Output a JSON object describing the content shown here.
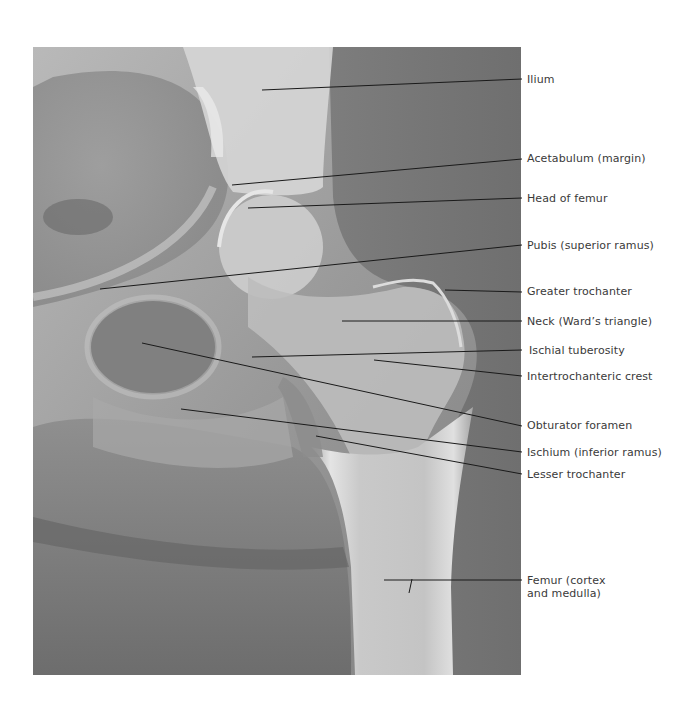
{
  "figure": {
    "image_description": "Anteroposterior radiograph of the right hip and proximal femur",
    "colors": {
      "background": "#ffffff",
      "leader_line": "#1a1a1a",
      "label_text": "#3a3a3a",
      "bone_light": "#d8d8d8",
      "soft_tissue": "#8a8a8a",
      "dark_region": "#5e5e5e"
    },
    "labels": [
      {
        "id": "ilium",
        "text": "Ilium",
        "top": 73,
        "line": [
          262,
          90,
          522,
          79
        ]
      },
      {
        "id": "acetabulum",
        "text": "Acetabulum (margin)",
        "top": 152,
        "line": [
          232,
          185,
          522,
          159
        ]
      },
      {
        "id": "head-of-femur",
        "text": "Head of femur",
        "top": 192,
        "line": [
          248,
          208,
          522,
          198
        ]
      },
      {
        "id": "pubis",
        "text": "Pubis (superior ramus)",
        "top": 239,
        "line": [
          100,
          289,
          522,
          245
        ]
      },
      {
        "id": "greater-trochanter",
        "text": "Greater trochanter",
        "top": 285,
        "line": [
          445,
          290,
          522,
          292
        ]
      },
      {
        "id": "neck",
        "text": "Neck (Ward’s triangle)",
        "top": 315,
        "line": [
          342,
          321,
          522,
          321
        ]
      },
      {
        "id": "ischial-tuberosity",
        "text": "Ischial tuberosity",
        "top": 344,
        "line": [
          252,
          357,
          522,
          350
        ]
      },
      {
        "id": "intertrochanteric-crest",
        "text": "Intertrochanteric crest",
        "top": 370,
        "line": [
          374,
          360,
          522,
          376
        ]
      },
      {
        "id": "obturator-foramen",
        "text": "Obturator foramen",
        "top": 419,
        "line": [
          142,
          343,
          522,
          426
        ]
      },
      {
        "id": "ischium",
        "text": "Ischium (inferior ramus)",
        "top": 446,
        "line": [
          181,
          409,
          522,
          452
        ]
      },
      {
        "id": "lesser-trochanter",
        "text": "Lesser trochanter",
        "top": 468,
        "line": [
          316,
          436,
          522,
          474
        ]
      },
      {
        "id": "femur",
        "text": "Femur (cortex\nand medulla)",
        "top": 574,
        "line": [
          384,
          580,
          522,
          580
        ],
        "tick": [
          412,
          579,
          410,
          593
        ]
      }
    ]
  }
}
